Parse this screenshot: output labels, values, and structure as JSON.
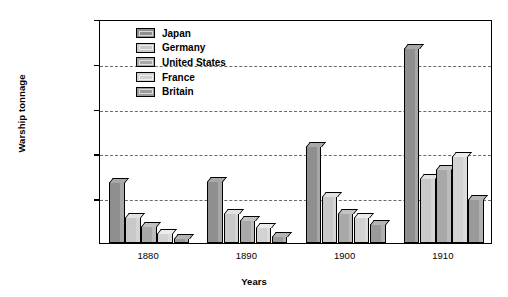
{
  "chart_data": {
    "type": "bar",
    "title": "",
    "xlabel": "Years",
    "ylabel": "Warship tonnage",
    "categories": [
      "1880",
      "1890",
      "1900",
      "1910"
    ],
    "ylim": [
      0,
      2500000
    ],
    "ytick_values": [
      0,
      500000,
      1000000,
      1500000,
      2000000,
      2500000
    ],
    "ytick_labels": [
      "0",
      "500,000",
      "1,000,000",
      "1,500,000",
      "2,000,000",
      "2,500,000"
    ],
    "grid": "horizontal-dashed",
    "legend_position": "inside-top-left",
    "series": [
      {
        "name": "Japan",
        "color": "#8f8f8f",
        "values": [
          680000,
          690000,
          1080000,
          2180000
        ]
      },
      {
        "name": "Germany",
        "color": "#c8c8c8",
        "values": [
          285000,
          330000,
          520000,
          725000
        ]
      },
      {
        "name": "United States",
        "color": "#a8a8a8",
        "values": [
          190000,
          255000,
          340000,
          830000
        ]
      },
      {
        "name": "France",
        "color": "#d2d2d2",
        "values": [
          110000,
          180000,
          290000,
          970000
        ]
      },
      {
        "name": "Britain",
        "color": "#9a9a9a",
        "values": [
          55000,
          80000,
          210000,
          490000
        ]
      }
    ]
  },
  "legend": {
    "items": [
      {
        "label": "Japan"
      },
      {
        "label": "Germany"
      },
      {
        "label": "United States"
      },
      {
        "label": "France"
      },
      {
        "label": "Britain"
      }
    ]
  }
}
